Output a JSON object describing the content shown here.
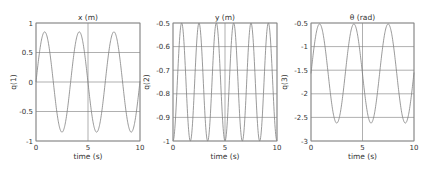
{
  "chart_data": [
    {
      "type": "line",
      "title": "x (m)",
      "xlabel": "time (s)",
      "ylabel": "q(1)",
      "xlim": [
        0,
        10
      ],
      "ylim": [
        -1,
        1
      ],
      "xticks": [
        0,
        5,
        10
      ],
      "yticks": [
        -1,
        -0.5,
        0,
        0.5,
        1
      ],
      "ytick_labels": [
        "-1",
        "-0.5",
        "0",
        "0.5",
        "1"
      ],
      "grid": true,
      "series": [
        {
          "name": "q(1)",
          "form": "sine",
          "offset": 0,
          "amplitude": 0.85,
          "period": 3.33,
          "phase": 0
        }
      ],
      "x": [
        0,
        0.83,
        1.67,
        2.5,
        3.33,
        4.17,
        5.0,
        5.83,
        6.67,
        7.5,
        8.33,
        9.17,
        10
      ],
      "values": [
        0,
        0.85,
        0,
        -0.85,
        0,
        0.85,
        0,
        -0.85,
        0,
        0.85,
        0,
        -0.85,
        0
      ]
    },
    {
      "type": "line",
      "title": "y (m)",
      "xlabel": "time (s)",
      "ylabel": "q(2)",
      "xlim": [
        0,
        10
      ],
      "ylim": [
        -1,
        -0.5
      ],
      "xticks": [
        0,
        5,
        10
      ],
      "yticks": [
        -1,
        -0.9,
        -0.8,
        -0.7,
        -0.6,
        -0.5
      ],
      "ytick_labels": [
        "-1",
        "-0.9",
        "-0.8",
        "-0.7",
        "-0.6",
        "-0.5"
      ],
      "grid": true,
      "series": [
        {
          "name": "q(2)",
          "form": "neg-cos",
          "offset": -0.75,
          "amplitude": 0.25,
          "period": 1.667,
          "phase": 0
        }
      ],
      "x": [
        0,
        0.83,
        1.67,
        2.5,
        3.33,
        4.17,
        5.0,
        5.83,
        6.67,
        7.5,
        8.33,
        9.17,
        10
      ],
      "values": [
        -1,
        -0.5,
        -1,
        -0.5,
        -1,
        -0.5,
        -1,
        -0.5,
        -1,
        -0.5,
        -1,
        -0.5,
        -1
      ]
    },
    {
      "type": "line",
      "title": "θ (rad)",
      "xlabel": "time (s)",
      "ylabel": "q(3)",
      "xlim": [
        0,
        10
      ],
      "ylim": [
        -3,
        -0.5
      ],
      "xticks": [
        0,
        5,
        10
      ],
      "yticks": [
        -3,
        -2.5,
        -2,
        -1.5,
        -1,
        -0.5
      ],
      "ytick_labels": [
        "-3",
        "-2.5",
        "-2",
        "-1.5",
        "-1",
        "-0.5"
      ],
      "grid": true,
      "series": [
        {
          "name": "q(3)",
          "form": "sine",
          "offset": -1.57,
          "amplitude": 1.05,
          "period": 3.33,
          "phase": 0
        }
      ],
      "x": [
        0,
        0.83,
        1.67,
        2.5,
        3.33,
        4.17,
        5.0,
        5.83,
        6.67,
        7.5,
        8.33,
        9.17,
        10
      ],
      "values": [
        -1.57,
        -0.52,
        -1.57,
        -2.62,
        -1.57,
        -0.52,
        -1.57,
        -2.62,
        -1.57,
        -0.52,
        -1.57,
        -2.62,
        -1.57
      ]
    }
  ],
  "layout": {
    "axes": [
      {
        "left": 36,
        "top": 23,
        "right": 140,
        "bottom": 141
      },
      {
        "left": 173,
        "top": 23,
        "right": 277,
        "bottom": 141
      },
      {
        "left": 311,
        "top": 23,
        "right": 414,
        "bottom": 141
      }
    ],
    "line_color": "#808080",
    "grid_color": "#7a7a7a",
    "frame_color": "#8a8a8a"
  }
}
